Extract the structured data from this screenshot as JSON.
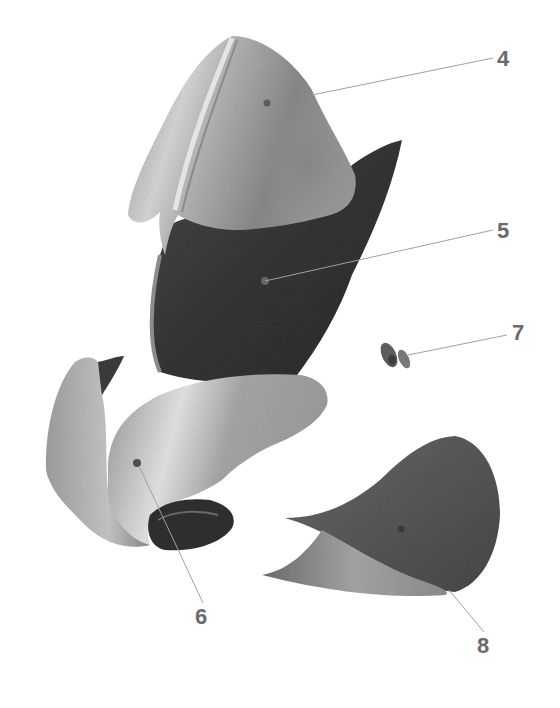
{
  "diagram": {
    "type": "exploded-view illustration",
    "background": "#ffffff",
    "label_color": "#6a6a6a",
    "leader_color": "#9a9a9a",
    "parts": [
      {
        "id": "4",
        "label": "4",
        "shape": "upper shell / cap piece",
        "fill": "#9b9b9b",
        "label_pos": [
          500,
          47
        ],
        "anchor": [
          267,
          103
        ]
      },
      {
        "id": "5",
        "label": "5",
        "shape": "dark lower shield piece",
        "fill": "#3c3c3c",
        "label_pos": [
          500,
          218
        ],
        "anchor": [
          265,
          281
        ]
      },
      {
        "id": "6",
        "label": "6",
        "shape": "curled lower piece",
        "fill": "#a8a8a8",
        "label_pos": [
          196,
          620
        ],
        "anchor": [
          137,
          463
        ]
      },
      {
        "id": "7",
        "label": "7",
        "shape": "small twin pellets",
        "fill": "#6e6e6e",
        "label_pos": [
          516,
          322
        ],
        "anchor": [
          405,
          354
        ]
      },
      {
        "id": "8",
        "label": "8",
        "shape": "textured horned piece",
        "fill": "#5a5a5a",
        "label_pos": [
          480,
          608
        ],
        "anchor": [
          450,
          589
        ]
      }
    ]
  }
}
